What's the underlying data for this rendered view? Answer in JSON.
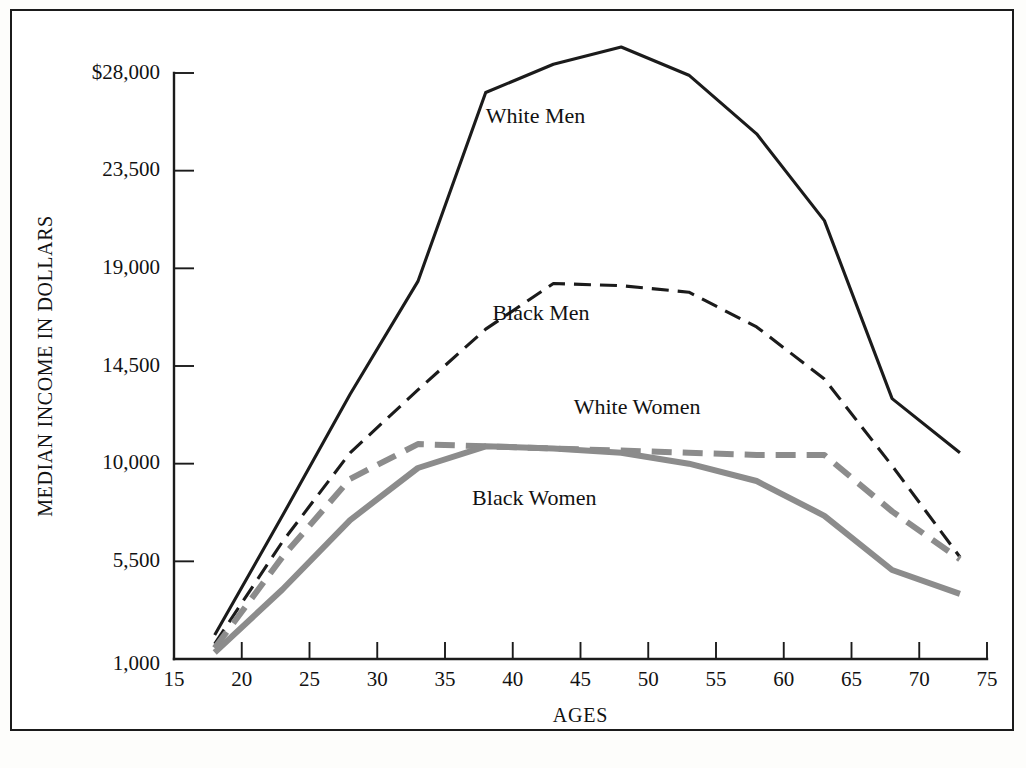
{
  "chart_data": {
    "type": "line",
    "title": "",
    "xlabel": "AGES",
    "ylabel": "MEDIAN INCOME IN DOLLARS",
    "xlim": [
      15,
      75
    ],
    "ylim": [
      1000,
      28000
    ],
    "xticks": [
      15,
      20,
      25,
      30,
      35,
      40,
      45,
      50,
      55,
      60,
      65,
      70,
      75
    ],
    "xtick_labels": [
      "15",
      "20",
      "25",
      "30",
      "35",
      "40",
      "45",
      "50",
      "55",
      "60",
      "65",
      "70",
      "75"
    ],
    "yticks": [
      1000,
      5500,
      10000,
      14500,
      19000,
      23500,
      28000
    ],
    "ytick_labels": [
      "1,000",
      "5,500",
      "10,000",
      "14,500",
      "19,000",
      "23,500",
      "$28,000"
    ],
    "grid": false,
    "legend_position": "inline-annotations",
    "series": [
      {
        "name": "White Men",
        "style": "solid",
        "color": "#1b1b1b",
        "width": 3.1,
        "label_x": 38,
        "label_y": 25700,
        "x": [
          18,
          23,
          28,
          33,
          38,
          43,
          48,
          53,
          58,
          63,
          68,
          73
        ],
        "values": [
          2100,
          7600,
          13200,
          18400,
          27100,
          28400,
          29200,
          27900,
          25200,
          21200,
          13000,
          10500
        ]
      },
      {
        "name": "Black Men",
        "style": "dashed",
        "color": "#1b1b1b",
        "width": 3.1,
        "label_x": 38.5,
        "label_y": 16600,
        "x": [
          18,
          23,
          28,
          33,
          38,
          43,
          48,
          53,
          58,
          63,
          68,
          73
        ],
        "values": [
          1700,
          6400,
          10500,
          13400,
          16200,
          18300,
          18200,
          17900,
          16300,
          13900,
          9900,
          5700
        ]
      },
      {
        "name": "White Women",
        "style": "dashed",
        "color": "#8c8c8c",
        "width": 6.0,
        "label_x": 44.5,
        "label_y": 12300,
        "x": [
          18,
          23,
          28,
          33,
          38,
          43,
          48,
          53,
          58,
          63,
          68,
          73
        ],
        "values": [
          1500,
          5700,
          9300,
          10900,
          10800,
          10700,
          10600,
          10500,
          10400,
          10400,
          7800,
          5600
        ]
      },
      {
        "name": "Black Women",
        "style": "solid",
        "color": "#8c8c8c",
        "width": 6.0,
        "label_x": 37,
        "label_y": 8100,
        "x": [
          18,
          23,
          28,
          33,
          38,
          43,
          48,
          53,
          58,
          63,
          68,
          73
        ],
        "values": [
          1300,
          4200,
          7400,
          9800,
          10800,
          10700,
          10500,
          10000,
          9200,
          7600,
          5100,
          4000
        ]
      }
    ]
  }
}
